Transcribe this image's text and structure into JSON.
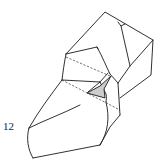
{
  "diagram": {
    "type": "origami-fold-step",
    "step_number": "12",
    "colors": {
      "line": "#1a1a1a",
      "shaded_flap": "#cccccc",
      "background": "#ffffff"
    },
    "elements": [
      {
        "name": "folded-model-outline",
        "style": "solid"
      },
      {
        "name": "valley-fold-line-upper",
        "style": "dashed"
      },
      {
        "name": "valley-fold-line-lower",
        "style": "dashed"
      },
      {
        "name": "shaded-inner-flap",
        "style": "filled-gray"
      }
    ]
  }
}
